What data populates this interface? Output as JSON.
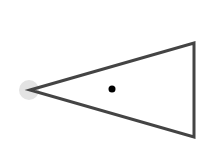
{
  "diagram": {
    "type": "triangle-with-points",
    "background": "#ffffff",
    "triangle": {
      "vertices": [
        [
          30,
          90
        ],
        [
          194,
          43
        ],
        [
          194,
          137
        ]
      ],
      "stroke": "#444444",
      "stroke_width": 3,
      "fill": "none"
    },
    "apex_highlight": {
      "cx": 29,
      "cy": 90,
      "r": 10,
      "fill": "#e3e3e3"
    },
    "center_dot": {
      "cx": 112,
      "cy": 89,
      "r": 3.5,
      "fill": "#000000"
    }
  }
}
